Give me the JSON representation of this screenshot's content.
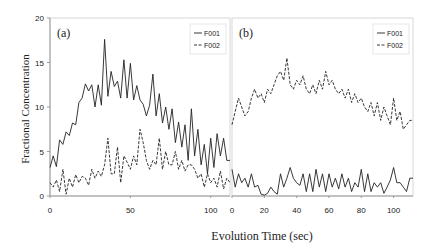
{
  "chart_data": [
    {
      "type": "line",
      "panel_label": "(a)",
      "xlabel": "Evolution Time (sec)",
      "ylabel": "Fractional Concentration",
      "xlim": [
        0,
        112
      ],
      "ylim": [
        0,
        20
      ],
      "xticks": [
        0,
        50,
        100
      ],
      "yticks": [
        0,
        5,
        10,
        15,
        20
      ],
      "grid": false,
      "legend": {
        "position": "upper right",
        "entries": [
          "F001",
          "F002"
        ]
      },
      "series": [
        {
          "name": "F001",
          "style": "solid",
          "x": [
            0,
            2,
            4,
            6,
            8,
            10,
            12,
            14,
            16,
            18,
            20,
            22,
            24,
            26,
            28,
            30,
            32,
            34,
            36,
            38,
            40,
            42,
            44,
            46,
            48,
            50,
            52,
            54,
            56,
            58,
            60,
            62,
            64,
            66,
            68,
            70,
            72,
            74,
            76,
            78,
            80,
            82,
            84,
            86,
            88,
            90,
            92,
            94,
            96,
            98,
            100,
            102,
            104,
            106,
            108,
            110,
            112
          ],
          "values": [
            3.2,
            4.5,
            3.3,
            6.3,
            5.8,
            7.2,
            6.8,
            8.2,
            8.0,
            10.5,
            11.0,
            12.6,
            11.8,
            12.5,
            10.0,
            12.5,
            10.2,
            17.6,
            11.2,
            14.0,
            12.3,
            12.9,
            11.0,
            15.3,
            11.0,
            14.9,
            10.8,
            12.4,
            10.8,
            10.3,
            9.0,
            10.2,
            13.7,
            9.0,
            11.5,
            8.2,
            10.0,
            7.5,
            9.8,
            6.0,
            8.3,
            5.5,
            8.0,
            4.0,
            9.8,
            4.5,
            7.5,
            3.5,
            5.8,
            2.5,
            6.5,
            3.2,
            7.0,
            4.5,
            6.5,
            4.0,
            4.0
          ]
        },
        {
          "name": "F002",
          "style": "dashed",
          "x": [
            0,
            2,
            4,
            6,
            8,
            10,
            12,
            14,
            16,
            18,
            20,
            22,
            24,
            26,
            28,
            30,
            32,
            34,
            36,
            38,
            40,
            42,
            44,
            46,
            48,
            50,
            52,
            54,
            56,
            58,
            60,
            62,
            64,
            66,
            68,
            70,
            72,
            74,
            76,
            78,
            80,
            82,
            84,
            86,
            88,
            90,
            92,
            94,
            96,
            98,
            100,
            102,
            104,
            106,
            108,
            110,
            112
          ],
          "values": [
            1.5,
            1.0,
            1.8,
            0.5,
            3.0,
            0.2,
            2.0,
            1.0,
            2.4,
            1.5,
            2.2,
            2.0,
            1.2,
            3.0,
            2.0,
            2.8,
            2.2,
            3.5,
            6.5,
            2.5,
            2.5,
            5.5,
            1.5,
            4.5,
            3.8,
            3.0,
            4.5,
            3.5,
            7.5,
            6.0,
            4.0,
            3.0,
            4.0,
            3.5,
            6.5,
            3.0,
            5.0,
            3.5,
            3.5,
            5.0,
            3.0,
            4.0,
            2.8,
            3.5,
            3.5,
            3.0,
            2.0,
            2.5,
            1.0,
            2.5,
            1.5,
            2.0,
            1.0,
            2.8,
            0.8,
            2.0,
            1.5
          ]
        }
      ]
    },
    {
      "type": "line",
      "panel_label": "(b)",
      "xlabel": "Evolution Time (sec)",
      "ylabel": "Fractional Concentration",
      "xlim": [
        0,
        112
      ],
      "ylim": [
        0,
        20
      ],
      "xticks": [
        0,
        20,
        40,
        60,
        80,
        100
      ],
      "yticks": [
        0,
        5,
        10,
        15,
        20
      ],
      "grid": false,
      "legend": {
        "position": "upper right",
        "entries": [
          "F001",
          "F002"
        ]
      },
      "series": [
        {
          "name": "F001",
          "style": "solid",
          "x": [
            0,
            2,
            4,
            6,
            8,
            10,
            12,
            14,
            16,
            18,
            20,
            22,
            24,
            26,
            28,
            30,
            32,
            34,
            36,
            38,
            40,
            42,
            44,
            46,
            48,
            50,
            52,
            54,
            56,
            58,
            60,
            62,
            64,
            66,
            68,
            70,
            72,
            74,
            76,
            78,
            80,
            82,
            84,
            86,
            88,
            90,
            92,
            94,
            96,
            98,
            100,
            102,
            104,
            106,
            108,
            110,
            112
          ],
          "values": [
            3.0,
            1.0,
            2.5,
            1.5,
            2.0,
            1.0,
            2.5,
            1.0,
            1.2,
            0.2,
            0.1,
            0.3,
            1.0,
            0.5,
            0.2,
            2.5,
            1.0,
            2.0,
            3.2,
            2.0,
            1.5,
            1.2,
            2.5,
            0.5,
            2.5,
            0.5,
            3.0,
            1.0,
            2.5,
            0.5,
            2.5,
            1.0,
            2.0,
            0.8,
            2.5,
            1.0,
            2.0,
            0.5,
            1.5,
            1.0,
            3.0,
            0.5,
            2.5,
            0.5,
            1.5,
            1.0,
            1.5,
            0.3,
            1.0,
            1.8,
            3.2,
            1.5,
            1.5,
            1.0,
            0.5,
            2.0,
            2.0
          ]
        },
        {
          "name": "F002",
          "style": "dashed",
          "x": [
            0,
            2,
            4,
            6,
            8,
            10,
            12,
            14,
            16,
            18,
            20,
            22,
            24,
            26,
            28,
            30,
            32,
            34,
            36,
            38,
            40,
            42,
            44,
            46,
            48,
            50,
            52,
            54,
            56,
            58,
            60,
            62,
            64,
            66,
            68,
            70,
            72,
            74,
            76,
            78,
            80,
            82,
            84,
            86,
            88,
            90,
            92,
            94,
            96,
            98,
            100,
            102,
            104,
            106,
            108,
            110,
            112
          ],
          "values": [
            8.0,
            9.5,
            11.0,
            10.0,
            9.0,
            9.5,
            11.0,
            12.0,
            11.0,
            11.5,
            10.5,
            12.0,
            11.5,
            12.5,
            13.5,
            14.0,
            13.0,
            15.5,
            12.5,
            12.0,
            13.0,
            12.5,
            13.5,
            12.0,
            11.5,
            12.5,
            11.5,
            13.0,
            12.0,
            14.0,
            12.5,
            13.0,
            12.0,
            11.5,
            12.0,
            11.0,
            12.0,
            10.5,
            11.5,
            10.5,
            11.0,
            10.0,
            9.5,
            10.5,
            9.0,
            10.5,
            8.5,
            10.0,
            9.0,
            8.0,
            11.0,
            8.5,
            9.5,
            7.5,
            8.0,
            8.5,
            8.5
          ]
        }
      ]
    }
  ]
}
